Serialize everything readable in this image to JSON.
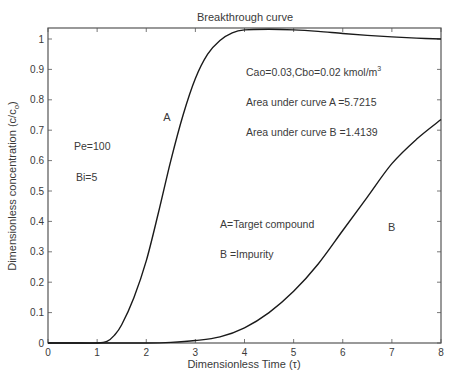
{
  "chart_data": {
    "type": "line",
    "title": "Breakthrough curve",
    "xlabel": "Dimensionless Time (τ)",
    "ylabel": "Dimensionless concentration (c/c",
    "ylabel_sub": "o",
    "ylabel_close": ")",
    "xlim": [
      0,
      8
    ],
    "ylim": [
      0,
      1.04
    ],
    "xticks": [
      0,
      1,
      2,
      3,
      4,
      5,
      6,
      7,
      8
    ],
    "xtick_labels": [
      "0",
      "1",
      "2",
      "3",
      "4",
      "5",
      "6",
      "7",
      "8"
    ],
    "yticks": [
      0,
      0.1,
      0.2,
      0.3,
      0.4,
      0.5,
      0.6,
      0.7,
      0.8,
      0.9,
      1
    ],
    "ytick_labels": [
      "0",
      "0.1",
      "0.2",
      "0.3",
      "0.4",
      "0.5",
      "0.6",
      "0.7",
      "0.8",
      "0.9",
      "1"
    ],
    "grid": false,
    "legend": null,
    "series": [
      {
        "name": "A",
        "description": "Target compound",
        "x": [
          0,
          0.5,
          1.0,
          1.2,
          1.35,
          1.5,
          1.75,
          2.0,
          2.25,
          2.5,
          2.75,
          3.0,
          3.25,
          3.5,
          3.75,
          4.0,
          4.5,
          5.0,
          5.5,
          6.0,
          6.5,
          7.0,
          7.5,
          8.0
        ],
        "values": [
          0,
          0,
          0,
          0.005,
          0.025,
          0.06,
          0.15,
          0.27,
          0.43,
          0.6,
          0.75,
          0.87,
          0.95,
          0.995,
          1.02,
          1.03,
          1.032,
          1.03,
          1.025,
          1.018,
          1.012,
          1.007,
          1.003,
          1.0
        ]
      },
      {
        "name": "B",
        "description": "Impurity",
        "x": [
          0,
          1.0,
          2.0,
          2.5,
          3.0,
          3.5,
          4.0,
          4.5,
          5.0,
          5.5,
          6.0,
          6.5,
          7.0,
          7.5,
          8.0
        ],
        "values": [
          0,
          0,
          0,
          0.002,
          0.008,
          0.02,
          0.05,
          0.1,
          0.17,
          0.26,
          0.37,
          0.48,
          0.59,
          0.67,
          0.735
        ]
      }
    ],
    "curve_labels": [
      {
        "text": "A",
        "x": 2.55,
        "y": 0.745
      },
      {
        "text": "B",
        "x": 7.0,
        "y": 0.38
      }
    ],
    "annotations": {
      "conc": "Cao=0.03,Cbo=0.02 kmol/m",
      "conc_sup": "3",
      "area_a": "Area under curve A =5.7215",
      "area_b": "Area under curve B =1.4139",
      "pe": "Pe=100",
      "bi": "Bi=5",
      "legend_a": "A=Target compound",
      "legend_b": "B =Impurity"
    },
    "colors": {
      "line": "#1a1a1a",
      "axis": "#555555",
      "text": "#3a3a3a"
    }
  }
}
